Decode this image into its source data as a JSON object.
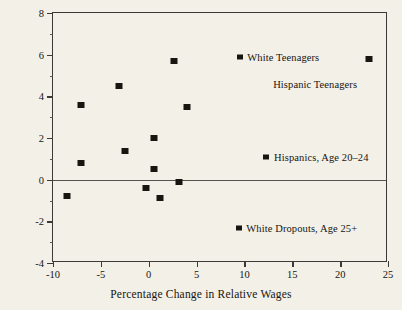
{
  "chart_data": {
    "type": "scatter",
    "title": "",
    "xlabel": "Percentage Change in Relative Wages",
    "ylabel": "Percentage Change in Relative Employment",
    "xlim": [
      -10,
      25
    ],
    "ylim": [
      -4,
      8
    ],
    "grid": false,
    "zero_line": true,
    "legend_position": "inside-plot",
    "xticks": [
      {
        "value": -10,
        "label": "-10"
      },
      {
        "value": -5,
        "label": "-5"
      },
      {
        "value": 0,
        "label": "0"
      },
      {
        "value": 5,
        "label": "5"
      },
      {
        "value": 10,
        "label": "10"
      },
      {
        "value": 15,
        "label": "15"
      },
      {
        "value": 20,
        "label": "20"
      },
      {
        "value": 25,
        "label": "25"
      }
    ],
    "yticks": [
      {
        "value": 8,
        "label": "8"
      },
      {
        "value": 6,
        "label": "6"
      },
      {
        "value": 4,
        "label": "4"
      },
      {
        "value": 2,
        "label": "2"
      },
      {
        "value": 0,
        "label": "0"
      },
      {
        "value": -2,
        "label": "-2"
      },
      {
        "value": -4,
        "label": "-4"
      }
    ],
    "yticks_minor": [
      7,
      5,
      3,
      1,
      -1,
      -3
    ],
    "marker_color": "#17150f",
    "marker_shape": "square",
    "points": [
      {
        "x": -8.5,
        "y": -0.8
      },
      {
        "x": -7.1,
        "y": 3.6
      },
      {
        "x": -7.1,
        "y": 0.8
      },
      {
        "x": -3.1,
        "y": 4.5
      },
      {
        "x": -2.5,
        "y": 1.4
      },
      {
        "x": -0.3,
        "y": -0.4
      },
      {
        "x": 0.5,
        "y": 2.0
      },
      {
        "x": 0.5,
        "y": 0.5
      },
      {
        "x": 1.2,
        "y": -0.9
      },
      {
        "x": 2.6,
        "y": 5.7
      },
      {
        "x": 3.2,
        "y": -0.1
      },
      {
        "x": 4.0,
        "y": 3.5
      },
      {
        "x": 23.0,
        "y": 5.8
      }
    ],
    "annotations": [
      {
        "label": "White Teenagers",
        "marker_x": 9.5,
        "marker_y": 5.9,
        "text_x": 10.3,
        "text_y": 5.9,
        "has_marker": true
      },
      {
        "label": "Hispanic Teenagers",
        "marker_x": 23.0,
        "marker_y": 5.8,
        "text_x": 13.0,
        "text_y": 4.6,
        "has_marker": false
      },
      {
        "label": "Hispanics, Age 20–24",
        "marker_x": 12.3,
        "marker_y": 1.1,
        "text_x": 13.1,
        "text_y": 1.1,
        "has_marker": true
      },
      {
        "label": "White Dropouts, Age 25+",
        "marker_x": 9.4,
        "marker_y": -2.3,
        "text_x": 10.2,
        "text_y": -2.3,
        "has_marker": true
      }
    ]
  }
}
